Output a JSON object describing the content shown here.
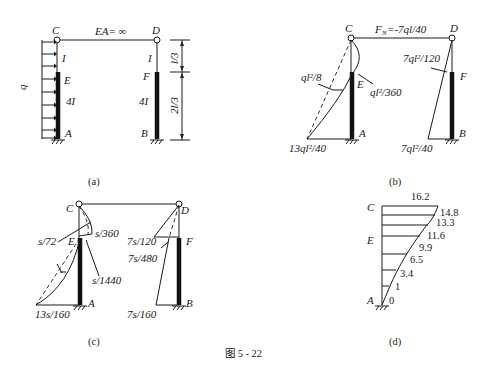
{
  "figure": {
    "caption": "图 5 - 22"
  },
  "panel_a": {
    "sublabel": "(a)",
    "nodes": {
      "C": "C",
      "D": "D",
      "E": "E",
      "F": "F",
      "A": "A",
      "B": "B"
    },
    "beam_label": "EA= ∞",
    "load_label": "q",
    "left_upper_inertia": "I",
    "left_lower_inertia": "4I",
    "right_upper_inertia": "I",
    "right_lower_inertia": "4I",
    "dim_upper": "l/3",
    "dim_lower": "2l/3"
  },
  "panel_b": {
    "sublabel": "(b)",
    "nodes": {
      "C": "C",
      "D": "D",
      "E": "E",
      "F": "F",
      "A": "A",
      "B": "B"
    },
    "axial_force": "F",
    "axial_force_sub": "N",
    "axial_force_value": "=-7ql/40",
    "m_mid_left": "ql²/8",
    "m_E": "ql²/360",
    "m_A": "13ql²/40",
    "m_F": "7ql²/120",
    "m_B": "7ql²/40"
  },
  "panel_c": {
    "sublabel": "(c)",
    "nodes": {
      "C": "C",
      "D": "D",
      "E": "E",
      "F": "F",
      "A": "A",
      "B": "B"
    },
    "v_s72": "s/72",
    "v_s360": "s/360",
    "v_s1440": "s/1440",
    "v_13s160": "13s/160",
    "v_7s120": "7s/120",
    "v_7s480": "7s/480",
    "v_7s160": "7s/160"
  },
  "panel_d": {
    "sublabel": "(d)",
    "nodes": {
      "C": "C",
      "E": "E",
      "A": "A"
    },
    "values": [
      "16.2",
      "14.8",
      "13.3",
      "11.6",
      "9.9",
      "6.5",
      "3.4",
      "1",
      "0"
    ]
  }
}
